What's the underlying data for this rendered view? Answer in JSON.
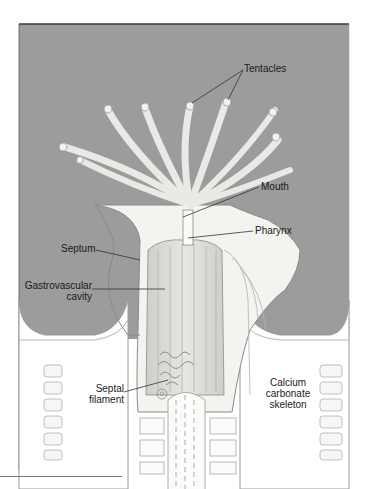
{
  "figure": {
    "colors": {
      "background_water": "#9a9a9a",
      "tissue": "#f1f1ee",
      "tissue_shade": "#d9d9d4",
      "outline": "#8a8a86",
      "frame": "#3a3a3a",
      "label_text": "#1a1a1a",
      "leader_line": "#333333"
    },
    "labels": {
      "tentacles": "Tentacles",
      "mouth": "Mouth",
      "pharynx": "Pharynx",
      "septum": "Septum",
      "gastrovascular_line1": "Gastrovascular",
      "gastrovascular_line2": "cavity",
      "septal_line1": "Septal",
      "septal_line2": "filament",
      "calcium_line1": "Calcium",
      "calcium_line2": "carbonate",
      "calcium_line3": "skeleton"
    }
  }
}
